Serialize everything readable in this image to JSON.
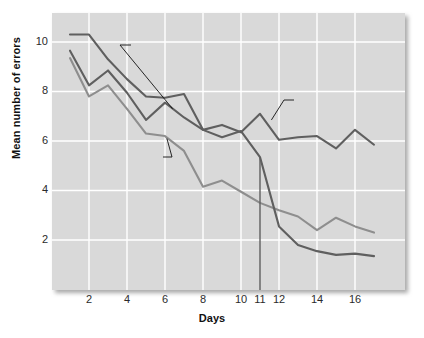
{
  "chart_data": {
    "type": "line",
    "title": "",
    "xlabel": "Days",
    "ylabel": "Mean number of errors",
    "xlim": [
      1,
      17
    ],
    "ylim": [
      0,
      11
    ],
    "xticks": [
      2,
      4,
      6,
      8,
      10,
      11,
      12,
      14,
      16
    ],
    "yticks": [
      2,
      4,
      6,
      8,
      10
    ],
    "grid": true,
    "legend": "annotations-on-plot",
    "x": [
      1,
      2,
      3,
      4,
      5,
      6,
      7,
      8,
      9,
      10,
      11,
      12,
      13,
      14,
      15,
      16,
      17
    ],
    "series": [
      {
        "name": "Group B",
        "description": "never reinforced",
        "color": "#5f5f5f",
        "values": [
          10.3,
          10.3,
          9.3,
          8.5,
          7.8,
          7.75,
          7.9,
          6.45,
          6.65,
          6.35,
          7.1,
          6.05,
          6.15,
          6.2,
          5.7,
          6.45,
          5.85
        ]
      },
      {
        "name": "Group C",
        "description": "reinforced on day 11",
        "color": "#5f5f5f",
        "values": [
          9.65,
          8.25,
          8.85,
          7.95,
          6.85,
          7.55,
          6.95,
          6.45,
          6.15,
          6.4,
          5.35,
          2.55,
          1.8,
          1.55,
          1.4,
          1.45,
          1.35
        ]
      },
      {
        "name": "Group A",
        "description": "reinforced on each trial",
        "color": "#8e8e8e",
        "values": [
          9.35,
          7.8,
          8.25,
          7.3,
          6.3,
          6.2,
          5.6,
          4.15,
          4.4,
          3.95,
          3.5,
          3.2,
          2.95,
          2.4,
          2.9,
          2.55,
          2.3
        ]
      }
    ],
    "marker_line": {
      "name": "day-11-marker",
      "x": 11,
      "y_top": 5.35,
      "y_bottom": 0,
      "color": "#5f5f5f"
    },
    "annotations": [
      {
        "id": "group-c",
        "lines": [
          "Group C",
          "(reinforced",
          "on day 11)"
        ],
        "leader_from_x": 6.4,
        "leader_from_y": 7.3
      },
      {
        "id": "group-b",
        "lines": [
          "Group B",
          "(never reinforced)"
        ],
        "leader_from_x": 11.6,
        "leader_from_y": 6.85
      },
      {
        "id": "group-a",
        "lines": [
          "Group A",
          "(reinforced",
          "on each trial)"
        ],
        "leader_from_x": 6.1,
        "leader_from_y": 6.1
      }
    ]
  },
  "axis": {
    "ylabel": "Mean number of errors",
    "xlabel": "Days",
    "yticks": [
      "10",
      "8",
      "6",
      "4",
      "2"
    ],
    "xticks": [
      "2",
      "4",
      "6",
      "8",
      "10",
      "11",
      "12",
      "14",
      "16"
    ]
  },
  "annotations": {
    "group_c": {
      "l1": "Group C",
      "l2": "(reinforced",
      "l3": "on day 11)"
    },
    "group_b": {
      "l1": "Group B",
      "l2": "(never reinforced)"
    },
    "group_a": {
      "l1": "Group A",
      "l2": "(reinforced",
      "l3": "on each trial)"
    }
  },
  "style": {
    "plot_bg": "#d9d9d9",
    "grid_color": "#ffffff",
    "dark_line": "#5f5f5f",
    "light_line": "#8e8e8e",
    "text_color": "#111111"
  }
}
